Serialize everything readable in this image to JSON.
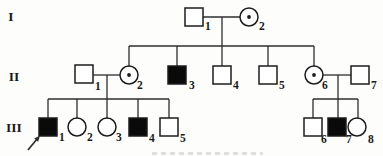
{
  "diagram": {
    "type": "pedigree-chart",
    "background": "#fdfdfc",
    "line_color": "#2e2e2e",
    "symbol_stroke": "#1c1c1c",
    "affected_fill": "#0a0a0a",
    "unaffected_fill": "#ffffff",
    "label_color": "#1a1a1a",
    "canvas_width": 383,
    "canvas_height": 156,
    "symbol_size": 18,
    "circle_radius": 9,
    "carrier_dot_radius": 1.9
  },
  "generation_labels": [
    {
      "text": "I",
      "x": 11,
      "y": 21
    },
    {
      "text": "II",
      "x": 14,
      "y": 81
    },
    {
      "text": "III",
      "x": 14,
      "y": 132
    }
  ],
  "individuals": [
    {
      "id": "I-1",
      "generation": "I",
      "sex": "male",
      "condition": "unaffected",
      "number": "1",
      "cx": 194,
      "cy": 17,
      "num_x": 205,
      "num_y": 30
    },
    {
      "id": "I-2",
      "generation": "I",
      "sex": "female",
      "condition": "carrier",
      "number": "2",
      "cx": 249,
      "cy": 17,
      "num_x": 259,
      "num_y": 30
    },
    {
      "id": "II-1",
      "generation": "II",
      "sex": "male",
      "condition": "unaffected",
      "number": "1",
      "cx": 84,
      "cy": 74,
      "num_x": 95,
      "num_y": 90
    },
    {
      "id": "II-2",
      "generation": "II",
      "sex": "female",
      "condition": "carrier",
      "number": "2",
      "cx": 129,
      "cy": 75,
      "num_x": 137,
      "num_y": 89
    },
    {
      "id": "II-3",
      "generation": "II",
      "sex": "male",
      "condition": "affected",
      "number": "3",
      "cx": 177,
      "cy": 75,
      "num_x": 189,
      "num_y": 89
    },
    {
      "id": "II-4",
      "generation": "II",
      "sex": "male",
      "condition": "unaffected",
      "number": "4",
      "cx": 222,
      "cy": 75,
      "num_x": 233,
      "num_y": 89
    },
    {
      "id": "II-5",
      "generation": "II",
      "sex": "male",
      "condition": "unaffected",
      "number": "5",
      "cx": 268,
      "cy": 75,
      "num_x": 279,
      "num_y": 89
    },
    {
      "id": "II-6",
      "generation": "II",
      "sex": "female",
      "condition": "carrier",
      "number": "6",
      "cx": 314,
      "cy": 75,
      "num_x": 322,
      "num_y": 89
    },
    {
      "id": "II-7",
      "generation": "II",
      "sex": "male",
      "condition": "unaffected",
      "number": "7",
      "cx": 360,
      "cy": 75,
      "num_x": 371,
      "num_y": 89
    },
    {
      "id": "III-1",
      "generation": "III",
      "sex": "male",
      "condition": "affected",
      "number": "1",
      "cx": 48,
      "cy": 127,
      "num_x": 59,
      "num_y": 141,
      "proband": true
    },
    {
      "id": "III-2",
      "generation": "III",
      "sex": "female",
      "condition": "unaffected",
      "number": "2",
      "cx": 77,
      "cy": 127,
      "num_x": 87,
      "num_y": 141
    },
    {
      "id": "III-3",
      "generation": "III",
      "sex": "female",
      "condition": "unaffected",
      "number": "3",
      "cx": 107,
      "cy": 127,
      "num_x": 116,
      "num_y": 141
    },
    {
      "id": "III-4",
      "generation": "III",
      "sex": "male",
      "condition": "affected",
      "number": "4",
      "cx": 138,
      "cy": 127,
      "num_x": 149,
      "num_y": 142
    },
    {
      "id": "III-5",
      "generation": "III",
      "sex": "male",
      "condition": "unaffected",
      "number": "5",
      "cx": 169,
      "cy": 127,
      "num_x": 180,
      "num_y": 142
    },
    {
      "id": "III-6",
      "generation": "III",
      "sex": "male",
      "condition": "unaffected",
      "number": "6",
      "cx": 313,
      "cy": 127,
      "num_x": 321,
      "num_y": 143
    },
    {
      "id": "III-7",
      "generation": "III",
      "sex": "male",
      "condition": "affected",
      "number": "7",
      "cx": 337,
      "cy": 127,
      "num_x": 346,
      "num_y": 143
    },
    {
      "id": "III-8",
      "generation": "III",
      "sex": "female",
      "condition": "unaffected",
      "number": "8",
      "cx": 357,
      "cy": 127,
      "num_x": 368,
      "num_y": 143
    }
  ],
  "connectors": [
    {
      "name": "couple-line-I1-I2",
      "x1": 203,
      "y1": 17,
      "x2": 240,
      "y2": 17
    },
    {
      "name": "descent-line-I-couple",
      "x1": 222,
      "y1": 17,
      "x2": 222,
      "y2": 46
    },
    {
      "name": "sibship-line-II",
      "x1": 129,
      "y1": 46,
      "x2": 314,
      "y2": 46
    },
    {
      "name": "drop-line-II-2",
      "x1": 129,
      "y1": 46,
      "x2": 129,
      "y2": 66
    },
    {
      "name": "drop-line-II-3",
      "x1": 177,
      "y1": 46,
      "x2": 177,
      "y2": 66
    },
    {
      "name": "drop-line-II-4",
      "x1": 222,
      "y1": 46,
      "x2": 222,
      "y2": 66
    },
    {
      "name": "drop-line-II-5",
      "x1": 268,
      "y1": 46,
      "x2": 268,
      "y2": 66
    },
    {
      "name": "drop-line-II-6",
      "x1": 314,
      "y1": 46,
      "x2": 314,
      "y2": 66
    },
    {
      "name": "couple-line-II1-II2",
      "x1": 93,
      "y1": 75,
      "x2": 120,
      "y2": 75
    },
    {
      "name": "descent-line-II1-II2",
      "x1": 107,
      "y1": 75,
      "x2": 107,
      "y2": 99
    },
    {
      "name": "sibship-line-III-left",
      "x1": 48,
      "y1": 99,
      "x2": 169,
      "y2": 99
    },
    {
      "name": "drop-line-III-1",
      "x1": 48,
      "y1": 99,
      "x2": 48,
      "y2": 118
    },
    {
      "name": "drop-line-III-2",
      "x1": 77,
      "y1": 99,
      "x2": 77,
      "y2": 118
    },
    {
      "name": "drop-line-III-3",
      "x1": 107,
      "y1": 99,
      "x2": 107,
      "y2": 118
    },
    {
      "name": "drop-line-III-4",
      "x1": 138,
      "y1": 99,
      "x2": 138,
      "y2": 118
    },
    {
      "name": "drop-line-III-5",
      "x1": 169,
      "y1": 99,
      "x2": 169,
      "y2": 118
    },
    {
      "name": "couple-line-II6-II7",
      "x1": 323,
      "y1": 75,
      "x2": 351,
      "y2": 75
    },
    {
      "name": "descent-line-II6-II7",
      "x1": 338,
      "y1": 75,
      "x2": 338,
      "y2": 99
    },
    {
      "name": "sibship-line-III-right",
      "x1": 313,
      "y1": 99,
      "x2": 358,
      "y2": 99
    },
    {
      "name": "drop-line-III-6",
      "x1": 313,
      "y1": 99,
      "x2": 313,
      "y2": 118
    },
    {
      "name": "drop-line-III-7",
      "x1": 338,
      "y1": 99,
      "x2": 338,
      "y2": 118
    },
    {
      "name": "drop-line-III-8",
      "x1": 358,
      "y1": 99,
      "x2": 358,
      "y2": 118
    }
  ],
  "proband_arrow": {
    "points_to": "III-1",
    "x1": 28,
    "y1": 150,
    "x2": 37,
    "y2": 139,
    "head_points": "40,135.5 38.2,141.8 34.2,138.4"
  },
  "caption_remnant": {
    "x1": 152,
    "y1": 153.5,
    "x2": 263,
    "y2": 153.5,
    "color": "#bcbcbc",
    "width": 3.2,
    "dash": "5 4",
    "opacity": 0.45
  }
}
